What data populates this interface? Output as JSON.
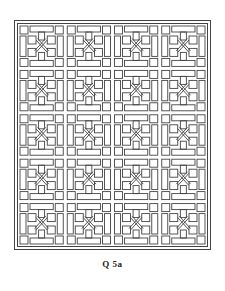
{
  "figure": {
    "caption": "Q 5a",
    "pattern": {
      "type": "geometric lattice",
      "columns": 4,
      "rows": 5,
      "line_color": "#444444",
      "background": "#ffffff"
    }
  }
}
